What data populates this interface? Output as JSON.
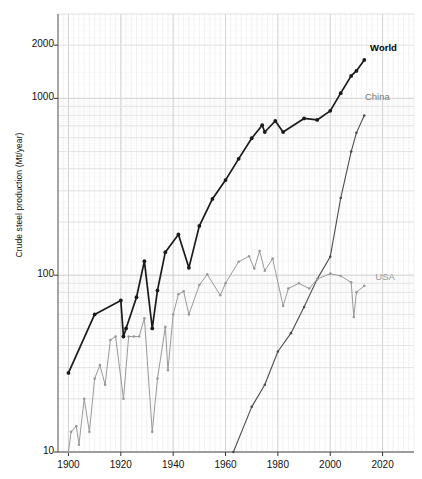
{
  "chart_data": {
    "type": "line",
    "title": "",
    "xlabel": "",
    "ylabel": "Crude steel production (Mt/year)",
    "xlim": [
      1896,
      2032
    ],
    "ylim": [
      10,
      3000
    ],
    "yscale": "log",
    "xscale": "linear",
    "grid": true,
    "minor_grid": true,
    "legend_position": "inline-right",
    "xticks": [
      1900,
      1920,
      1940,
      1960,
      1980,
      2000,
      2020
    ],
    "xticklabels": [
      "1900",
      "1920",
      "1940",
      "1960",
      "1980",
      "2000",
      "2020"
    ],
    "yticks": [
      10,
      100,
      1000,
      2000
    ],
    "yticklabels": [
      "10",
      "100",
      "1000",
      "2000"
    ],
    "series": [
      {
        "name": "World",
        "color": "#1a1a1a",
        "label_color": "#000000",
        "label_bold": true,
        "label_x": 2016,
        "label_y": 1900,
        "marker": "dot",
        "x": [
          1900,
          1910,
          1920,
          1921,
          1922,
          1926,
          1929,
          1932,
          1934,
          1937,
          1942,
          1946,
          1950,
          1955,
          1960,
          1965,
          1970,
          1974,
          1975,
          1979,
          1982,
          1990,
          1995,
          2000,
          2004,
          2008,
          2010,
          2013
        ],
        "values": [
          28,
          60,
          72,
          45,
          50,
          75,
          120,
          50,
          82,
          135,
          170,
          110,
          190,
          270,
          345,
          455,
          595,
          705,
          645,
          745,
          645,
          770,
          755,
          850,
          1070,
          1340,
          1430,
          1650
        ]
      },
      {
        "name": "China",
        "color": "#4d4d4d",
        "label_color": "#7a7a7a",
        "label_bold": false,
        "label_x": 2014,
        "label_y": 1000,
        "marker": "dot",
        "x": [
          1963,
          1970,
          1975,
          1980,
          1985,
          1990,
          1995,
          2000,
          2004,
          2008,
          2010,
          2013
        ],
        "values": [
          10,
          18,
          24,
          37,
          47,
          66,
          95,
          127,
          273,
          500,
          638,
          800
        ]
      },
      {
        "name": "USA",
        "color": "#9a9a9a",
        "label_color": "#9a9a9a",
        "label_bold": false,
        "label_x": 2018,
        "label_y": 96,
        "marker": "dot",
        "x": [
          1900,
          1901,
          1903,
          1904,
          1906,
          1908,
          1910,
          1912,
          1914,
          1916,
          1918,
          1921,
          1923,
          1925,
          1927,
          1929,
          1932,
          1934,
          1937,
          1938,
          1940,
          1942,
          1944,
          1946,
          1950,
          1953,
          1958,
          1960,
          1965,
          1969,
          1971,
          1973,
          1975,
          1978,
          1982,
          1984,
          1988,
          1992,
          1995,
          2000,
          2004,
          2008,
          2009,
          2010,
          2013
        ],
        "values": [
          10,
          13,
          14,
          11,
          20,
          13,
          26,
          31,
          24,
          43,
          45,
          20,
          45,
          45,
          45,
          57,
          13,
          26,
          51,
          29,
          60,
          78,
          81,
          60,
          88,
          101,
          77,
          90,
          119,
          128,
          109,
          137,
          106,
          124,
          67,
          84,
          90,
          84,
          95,
          102,
          99,
          91,
          58,
          80,
          87
        ]
      }
    ]
  },
  "axis": {
    "ylabel_text": "Crude steel production (Mt/year)"
  }
}
